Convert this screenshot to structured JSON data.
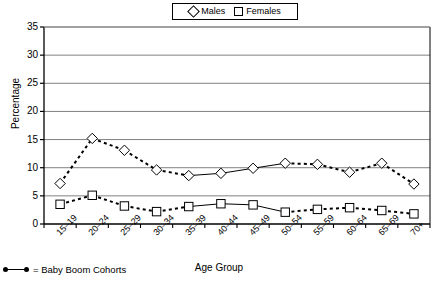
{
  "chart_data": {
    "type": "line",
    "title": "",
    "xlabel": "Age Group",
    "ylabel": "Percentage",
    "ylim": [
      0,
      35
    ],
    "yticks": [
      0,
      5,
      10,
      15,
      20,
      25,
      30,
      35
    ],
    "grid": true,
    "legend_position": "top-center",
    "categories": [
      "15–19",
      "20–24",
      "25–29",
      "30–34",
      "35–39",
      "40–44",
      "45–49",
      "50–54",
      "55–59",
      "60–64",
      "65–69",
      "70+"
    ],
    "series": [
      {
        "name": "Males",
        "marker": "diamond",
        "values": [
          7.2,
          15.2,
          13.1,
          9.6,
          8.6,
          9.0,
          9.9,
          10.8,
          10.6,
          9.2,
          10.8,
          7.1
        ]
      },
      {
        "name": "Females",
        "marker": "square",
        "values": [
          3.5,
          5.1,
          3.2,
          2.2,
          3.1,
          3.6,
          3.4,
          2.1,
          2.6,
          2.9,
          2.4,
          1.8
        ]
      }
    ],
    "solid_segment_categories": [
      "35–39",
      "40–44",
      "45–49",
      "50–54"
    ],
    "annotations": [
      {
        "text": "= Baby Boom Cohorts",
        "marker": "dot-line-dot"
      }
    ]
  },
  "legend": {
    "males_label": "Males",
    "females_label": "Females"
  },
  "footnote": {
    "text": "= Baby Boom Cohorts"
  },
  "axes": {
    "y_title": "Percentage",
    "x_title": "Age Group"
  }
}
